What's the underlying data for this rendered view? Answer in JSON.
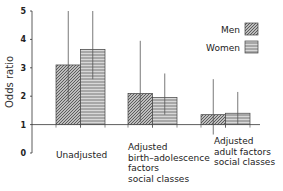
{
  "chart_data": {
    "type": "bar",
    "title": "",
    "xlabel": "",
    "ylabel": "Odds ratio",
    "ylim": [
      0,
      5
    ],
    "yticks": [
      0,
      1,
      2,
      3,
      4,
      5
    ],
    "baseline": 1,
    "grid": false,
    "legend_position": "upper right",
    "categories": [
      [
        "Unadjusted"
      ],
      [
        "Adjusted",
        "birth–adolescence",
        "factors",
        "social classes"
      ],
      [
        "Adjusted",
        "adult factors",
        "social classes"
      ]
    ],
    "series": [
      {
        "name": "Men",
        "pattern": "diagonal-hatch",
        "values": [
          3.1,
          2.1,
          1.35
        ],
        "ci_low": [
          1.8,
          1.1,
          0.65
        ],
        "ci_high": [
          5.0,
          3.95,
          2.6
        ]
      },
      {
        "name": "Women",
        "pattern": "horizontal-lines",
        "values": [
          3.65,
          1.95,
          1.4
        ],
        "ci_low": [
          2.6,
          1.35,
          1.0
        ],
        "ci_high": [
          5.0,
          2.8,
          2.15
        ]
      }
    ]
  }
}
